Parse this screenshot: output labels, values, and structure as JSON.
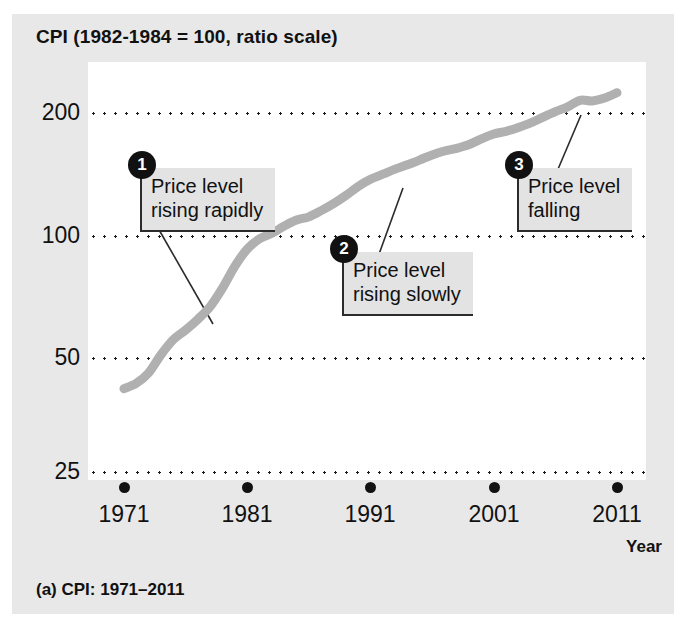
{
  "figure": {
    "chart_title": "CPI (1982-1984 = 100, ratio scale)",
    "caption": "(a) CPI: 1971–2011",
    "xaxis_title": "Year"
  },
  "chart_data": {
    "type": "line",
    "title": "CPI (1982-1984 = 100, ratio scale)",
    "xlabel": "Year",
    "ylabel": "CPI (1982-1984 = 100, ratio scale)",
    "scale": "log",
    "grid": true,
    "legend": "none",
    "xlim": [
      1971,
      2011
    ],
    "ylim": [
      25,
      240
    ],
    "xticks": [
      1971,
      1981,
      1991,
      2001,
      2011
    ],
    "xtick_labels": [
      "1971",
      "1981",
      "1991",
      "2001",
      "2011"
    ],
    "yticks": [
      25,
      50,
      100,
      200
    ],
    "ytick_labels": [
      "25",
      "50",
      "100",
      "200"
    ],
    "series": [
      {
        "name": "CPI",
        "color": "#b0b0b0",
        "x": [
          1971,
          1972,
          1973,
          1974,
          1975,
          1976,
          1977,
          1978,
          1979,
          1980,
          1981,
          1982,
          1983,
          1984,
          1985,
          1986,
          1987,
          1988,
          1989,
          1990,
          1991,
          1992,
          1993,
          1994,
          1995,
          1996,
          1997,
          1998,
          1999,
          2000,
          2001,
          2002,
          2003,
          2004,
          2005,
          2006,
          2007,
          2008,
          2009,
          2010,
          2011
        ],
        "values": [
          40.5,
          41.8,
          44.4,
          49.3,
          53.8,
          56.9,
          60.6,
          65.2,
          72.6,
          82.4,
          90.9,
          96.5,
          99.6,
          103.9,
          107.6,
          109.6,
          113.6,
          118.3,
          124.0,
          130.7,
          136.2,
          140.3,
          144.5,
          148.2,
          152.4,
          156.9,
          160.5,
          163.0,
          166.6,
          172.2,
          177.1,
          179.9,
          184.0,
          188.9,
          195.3,
          201.6,
          207.3,
          215.3,
          214.5,
          218.1,
          224.9
        ]
      }
    ],
    "annotations": [
      {
        "number": "1",
        "text": "Price level\nrising rapidly",
        "anchor_year": 1977,
        "anchor_value": 62
      },
      {
        "number": "2",
        "text": "Price level\nrising slowly",
        "anchor_year": 1993,
        "anchor_value": 150
      },
      {
        "number": "3",
        "text": "Price level\nfalling",
        "anchor_year": 2008,
        "anchor_value": 215
      }
    ]
  },
  "yticks": [
    {
      "label": "200",
      "value": 200,
      "y": 113
    },
    {
      "label": "100",
      "value": 100,
      "y": 236
    },
    {
      "label": "50",
      "value": 50,
      "y": 358
    },
    {
      "label": "25",
      "value": 25,
      "y": 472
    }
  ],
  "xticks": [
    {
      "label": "1971",
      "value": 1971,
      "x": 124
    },
    {
      "label": "1981",
      "value": 1981,
      "x": 247
    },
    {
      "label": "1991",
      "value": 1991,
      "x": 370
    },
    {
      "label": "2001",
      "value": 2001,
      "x": 494
    },
    {
      "label": "2011",
      "value": 2011,
      "x": 617
    }
  ],
  "callouts": [
    {
      "number": "1",
      "text": "Price level\nrising rapidly",
      "left": 140,
      "top": 168,
      "leader": {
        "x1": 158,
        "y1": 228,
        "x2": 213,
        "y2": 324
      }
    },
    {
      "number": "2",
      "text": "Price level\nrising slowly",
      "left": 342,
      "top": 252,
      "leader": {
        "x1": 358,
        "y1": 312,
        "x2": 403,
        "y2": 188
      }
    },
    {
      "number": "3",
      "text": "Price level\nfalling",
      "left": 517,
      "top": 168,
      "leader": {
        "x1": 533,
        "y1": 228,
        "x2": 581,
        "y2": 115
      }
    }
  ]
}
